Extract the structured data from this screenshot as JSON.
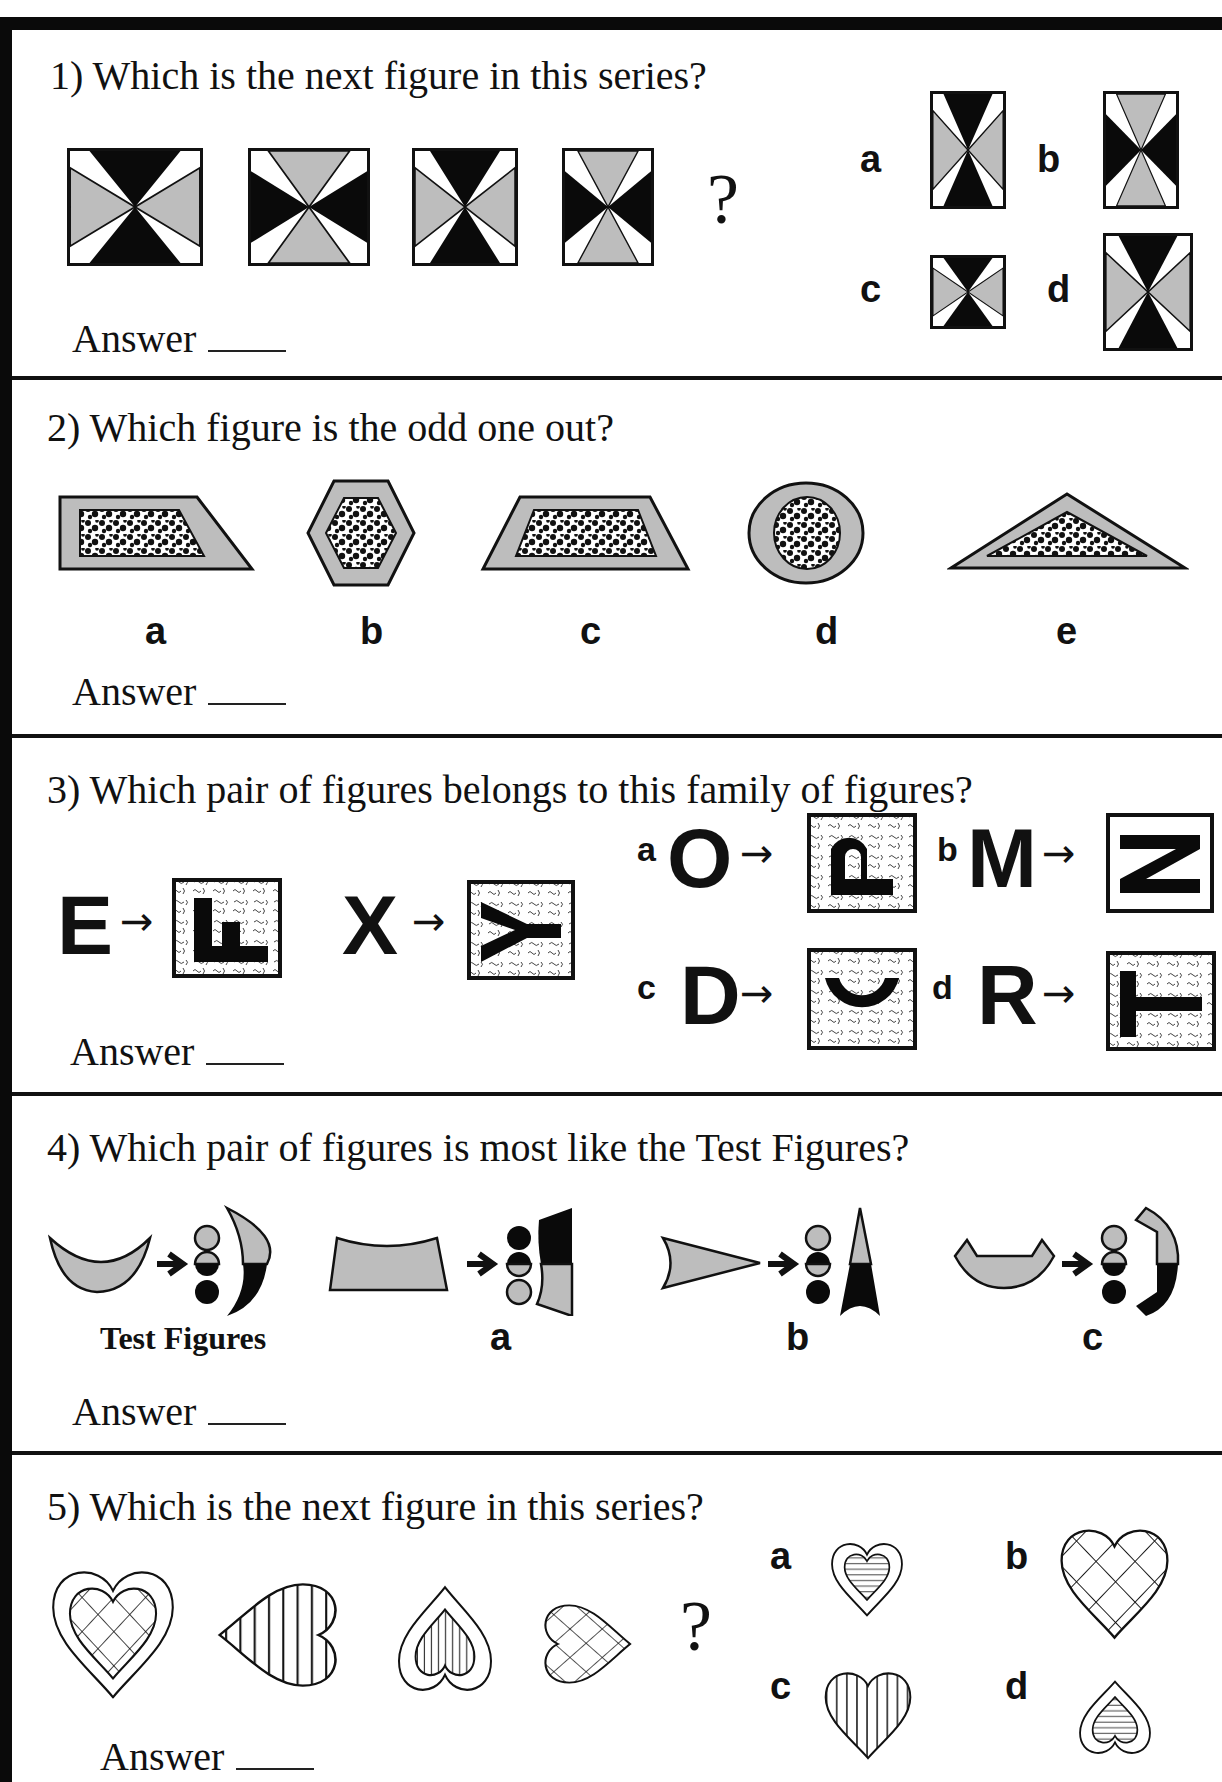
{
  "worksheet": {
    "questions": [
      {
        "number": "1)",
        "prompt": "1) Which is the next figure in this series?",
        "answer_label": "Answer",
        "question_mark": "?",
        "options": [
          "a",
          "b",
          "c",
          "d"
        ]
      },
      {
        "number": "2)",
        "prompt": "2) Which figure is the odd one out?",
        "answer_label": "Answer",
        "options": [
          "a",
          "b",
          "c",
          "d",
          "e"
        ]
      },
      {
        "number": "3)",
        "prompt": "3) Which pair of figures belongs to this family of figures?",
        "answer_label": "Answer",
        "examples": [
          {
            "from": "E",
            "to": "F"
          },
          {
            "from": "X",
            "to": "Y"
          }
        ],
        "options": [
          {
            "label": "a",
            "from": "O",
            "to": "P"
          },
          {
            "label": "b",
            "from": "M",
            "to": "N"
          },
          {
            "label": "c",
            "from": "D",
            "to": "C"
          },
          {
            "label": "d",
            "from": "R",
            "to": "T"
          }
        ],
        "arrow": "→"
      },
      {
        "number": "4)",
        "prompt": "4) Which pair of figures is most like the Test Figures?",
        "answer_label": "Answer",
        "test_label": "Test Figures",
        "options": [
          "a",
          "b",
          "c"
        ]
      },
      {
        "number": "5)",
        "prompt": "5) Which is the next figure in this series?",
        "answer_label": "Answer",
        "question_mark": "?",
        "options": [
          "a",
          "b",
          "c",
          "d"
        ]
      }
    ]
  },
  "colors": {
    "black": "#0a0a0a",
    "gray": "#bdbdbd",
    "white": "#ffffff"
  }
}
